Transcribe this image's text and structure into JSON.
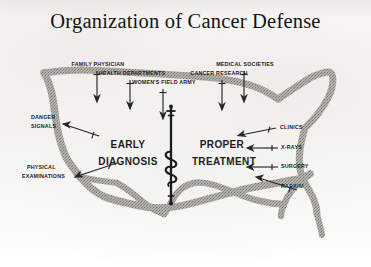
{
  "poster": {
    "title": "Organization of Cancer Defense",
    "background_color": "#f4f3f1",
    "ink_color": "#232323",
    "map_fill_color": "#a9a6a1",
    "map_outline_color": "#6e6a66",
    "map_subject": "united-states-outline"
  },
  "center": {
    "left_label": "EARLY\nDIAGNOSIS",
    "left_line1": "EARLY",
    "left_line2": "DIAGNOSIS",
    "right_line1": "PROPER",
    "right_line2": "TREATMENT",
    "emblem": "staff-of-asclepius"
  },
  "top_labels": [
    {
      "id": "family-physician",
      "text": "FAMILY PHYSICIAN",
      "arrow": "down"
    },
    {
      "id": "health-departments",
      "text": "HEALTH DEPARTMENTS",
      "arrow": "down"
    },
    {
      "id": "womens-field-army",
      "text": "WOMEN'S FIELD ARMY",
      "arrow": "down"
    },
    {
      "id": "medical-societies",
      "text": "MEDICAL SOCIETIES",
      "arrow": "down"
    },
    {
      "id": "cancer-research",
      "text": "CANCER RESEARCH",
      "arrow": "down"
    }
  ],
  "left_labels": [
    {
      "id": "danger-signals",
      "line1": "DANGER",
      "line2": "SIGNALS",
      "arrow": "right"
    },
    {
      "id": "physical-examinations",
      "line1": "PHYSICAL",
      "line2": "EXAMINATIONS",
      "arrow": "right"
    }
  ],
  "right_labels": [
    {
      "id": "clinics",
      "text": "CLINICS",
      "arrow": "left"
    },
    {
      "id": "x-rays",
      "text": "X-RAYS",
      "arrow": "left"
    },
    {
      "id": "surgery",
      "text": "SURGERY",
      "arrow": "left"
    },
    {
      "id": "radium",
      "text": "RADIUM",
      "arrow": "left"
    }
  ]
}
